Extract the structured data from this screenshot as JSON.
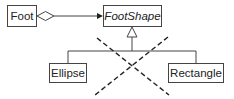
{
  "diagram": {
    "type": "uml-class-diagram",
    "classes": [
      {
        "id": "foot",
        "name": "Foot",
        "abstract": false
      },
      {
        "id": "footshape",
        "name": "FootShape",
        "abstract": true
      },
      {
        "id": "ellipse",
        "name": "Ellipse",
        "abstract": false
      },
      {
        "id": "rectangle",
        "name": "Rectangle",
        "abstract": false
      }
    ],
    "relationships": [
      {
        "type": "aggregation",
        "from": "Foot",
        "to": "FootShape",
        "navigable": true
      },
      {
        "type": "generalization",
        "from": "Ellipse",
        "to": "FootShape"
      },
      {
        "type": "generalization",
        "from": "Rectangle",
        "to": "FootShape"
      }
    ],
    "annotations": [
      {
        "type": "dashed-cross",
        "meaning": "inheritance hierarchy crossed out"
      }
    ],
    "colors": {
      "line": "#444444",
      "text": "#222222",
      "background": "#ffffff"
    }
  }
}
